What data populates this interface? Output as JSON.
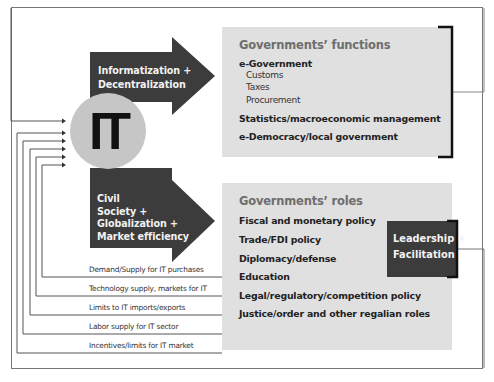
{
  "diagram": {
    "center_node": {
      "label": "IT",
      "color": "#c6c6c6"
    },
    "arrows": [
      {
        "id": "top",
        "lines": [
          "Informatization +",
          "Decentralization"
        ],
        "color": "#3c3c3c"
      },
      {
        "id": "bottom",
        "lines": [
          "Civil",
          "Society +",
          "Globalization +",
          "Market efficiency"
        ],
        "color": "#3c3c3c"
      }
    ],
    "functions_box": {
      "title": "Governments’ functions",
      "items": [
        {
          "label": "e-Government",
          "subitems": [
            "Customs",
            "Taxes",
            "Procurement"
          ]
        },
        {
          "label": "Statistics/macroeconomic management",
          "subitems": []
        },
        {
          "label": "e-Democracy/local government",
          "subitems": []
        }
      ],
      "color": "#e0e0e0"
    },
    "roles_box": {
      "title": "Governments’ roles",
      "items": [
        "Fiscal and monetary policy",
        "Trade/FDI policy",
        "Diplomacy/defense",
        "Education",
        "Legal/regulatory/competition policy",
        "Justice/order and other regalian roles"
      ],
      "color": "#e0e0e0"
    },
    "leadership_box": {
      "lines": [
        "Leadership +",
        "Facilitation"
      ],
      "color": "#3c3c3c"
    },
    "feedback_flows": [
      "Demand/Supply for IT purchases",
      "Technology supply, markets for IT",
      "Limits to IT imports/exports",
      "Labor supply for IT sector",
      "Incentives/limits for IT market"
    ]
  }
}
